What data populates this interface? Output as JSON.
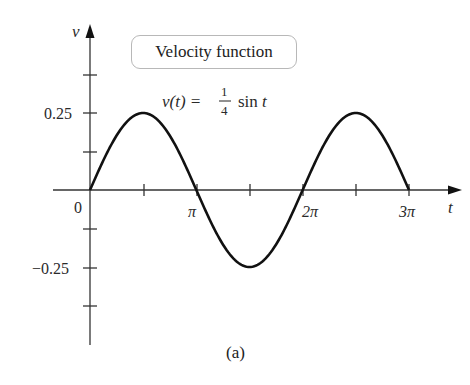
{
  "chart_data": {
    "type": "line",
    "title": "Velocity function",
    "equation": "v(t) = (1/4) sin t",
    "equation_parts": {
      "lhs": "v(t) =",
      "num": "1",
      "den": "4",
      "rhs": "sin t"
    },
    "xlabel": "t",
    "ylabel": "v",
    "caption": "(a)",
    "xlim": [
      0,
      9.42477796
    ],
    "ylim": [
      -0.4375,
      0.4375
    ],
    "x_ticks": [
      0,
      1.5708,
      3.1416,
      4.7124,
      6.2832,
      7.854,
      9.4248
    ],
    "x_tick_labels": [
      "0",
      "",
      "π",
      "",
      "2π",
      "",
      "3π"
    ],
    "y_ticks": [
      0.375,
      0.25,
      0.125,
      -0.125,
      -0.25,
      -0.375
    ],
    "y_tick_labels": [
      "",
      "0.25",
      "",
      "",
      "-0.25",
      ""
    ],
    "grid": false,
    "series": [
      {
        "name": "v(t) = 1/4 sin t",
        "x": [
          0,
          0.7854,
          1.5708,
          2.3562,
          3.1416,
          3.927,
          4.7124,
          5.4978,
          6.2832,
          7.0686,
          7.854,
          8.6394,
          9.4248
        ],
        "values": [
          0,
          0.1768,
          0.25,
          0.1768,
          0,
          -0.1768,
          -0.25,
          -0.1768,
          0,
          0.1768,
          0.25,
          0.1768,
          0
        ]
      }
    ]
  },
  "labels": {
    "title_box": "Velocity function",
    "eq_lhs": "v(t) =",
    "eq_num": "1",
    "eq_den": "4",
    "eq_rhs": "sin t",
    "y_axis": "v",
    "x_axis": "t",
    "origin": "0",
    "pi": "π",
    "two_pi": "2π",
    "three_pi": "3π",
    "y_pos": "0.25",
    "y_neg": "−0.25",
    "caption": "(a)"
  }
}
